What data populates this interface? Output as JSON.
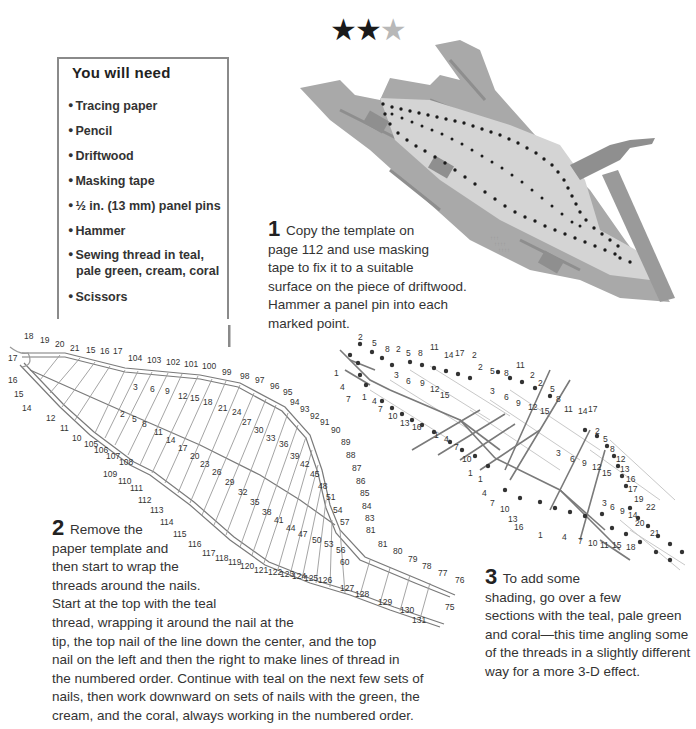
{
  "difficulty": {
    "stars_filled": "★★",
    "stars_empty": "★",
    "rating": "2 of 3"
  },
  "materials": {
    "title": "You will need",
    "items": [
      {
        "label": "Tracing paper"
      },
      {
        "label": "Pencil"
      },
      {
        "label": "Driftwood"
      },
      {
        "label": "Masking tape"
      },
      {
        "label": "½ in. (13 mm) panel pins"
      },
      {
        "label": "Hammer"
      },
      {
        "label": "Sewing thread in teal,"
      },
      {
        "label": "pale green, cream, coral"
      },
      {
        "label": "Scissors"
      }
    ]
  },
  "steps": [
    {
      "number": "1",
      "lines": [
        "Copy the template on",
        "page 112 and use masking",
        "tape to fix it to a suitable",
        "surface on the piece of driftwood.",
        "Hammer a panel pin into each",
        "marked point."
      ]
    },
    {
      "number": "2",
      "lines": [
        "Remove the",
        "paper template and",
        "then start to wrap the",
        "threads around the nails.",
        "Start at the top with the teal",
        "thread, wrapping it around the nail at the",
        "tip, the top nail of the line down the center, and the top",
        "nail on the left and then the right to make lines of thread in",
        "the numbered order. Continue with teal on the next few sets of",
        "nails, then work downward on sets of nails with the green, the",
        "cream, and the coral, always working in the numbered order."
      ]
    },
    {
      "number": "3",
      "lines": [
        "To add some",
        "shading, go over a few",
        "sections with the teal, pale green",
        "and coral—this time angling some",
        "of the threads in a slightly different",
        "way for a more 3-D effect."
      ]
    }
  ],
  "diagram2_labels": {
    "tip": [
      "18",
      "19",
      "20",
      "21",
      "15",
      "16",
      "17",
      "17",
      "16",
      "15",
      "14",
      "12",
      "11",
      "10"
    ],
    "top_edge": [
      "104",
      "103",
      "102",
      "101",
      "100",
      "99",
      "98",
      "97",
      "96",
      "95",
      "94",
      "93",
      "92",
      "91",
      "90",
      "89",
      "88",
      "87",
      "86",
      "85",
      "84",
      "83",
      "81",
      "81",
      "80",
      "79",
      "78",
      "77",
      "76"
    ],
    "bottom_edge": [
      "105",
      "106",
      "107",
      "108",
      "109",
      "110",
      "111",
      "112",
      "113",
      "114",
      "115",
      "116",
      "117",
      "118",
      "119",
      "120",
      "121",
      "122",
      "123",
      "124",
      "125",
      "126",
      "127",
      "128",
      "129",
      "130",
      "131"
    ],
    "inner_top": [
      "3",
      "6",
      "9",
      "12",
      "15",
      "18",
      "21",
      "24",
      "27",
      "30",
      "33",
      "36",
      "39",
      "42",
      "45",
      "48",
      "51",
      "54",
      "57"
    ],
    "inner_bottom": [
      "2",
      "5",
      "8",
      "11",
      "14",
      "17",
      "20",
      "23",
      "26",
      "29",
      "32",
      "35",
      "38",
      "41",
      "44",
      "47",
      "50",
      "53",
      "56",
      "60"
    ]
  },
  "diagram3_labels": {
    "top": [
      "2",
      "5",
      "8",
      "2",
      "5",
      "8",
      "11",
      "14",
      "17",
      "2",
      "2",
      "5",
      "8",
      "11",
      "2",
      "2",
      "5",
      "8",
      "11",
      "14",
      "17",
      "2",
      "5",
      "8",
      "12",
      "13",
      "16",
      "17",
      "19",
      "22"
    ],
    "bottom": [
      "1",
      "4",
      "7",
      "1",
      "4",
      "7",
      "10",
      "13",
      "16",
      "1",
      "1",
      "4",
      "7",
      "10",
      "13",
      "16",
      "1",
      "4",
      "7",
      "10",
      "11",
      "15",
      "18",
      "21",
      "20"
    ]
  },
  "colors": {
    "driftwood": "#a9a9a9",
    "template": "#d4d4d4",
    "hammer": "#8f8f8f",
    "box_border": "#8a8a8a",
    "thread": "#9a9a9a",
    "nail": "#1a1a1a"
  }
}
